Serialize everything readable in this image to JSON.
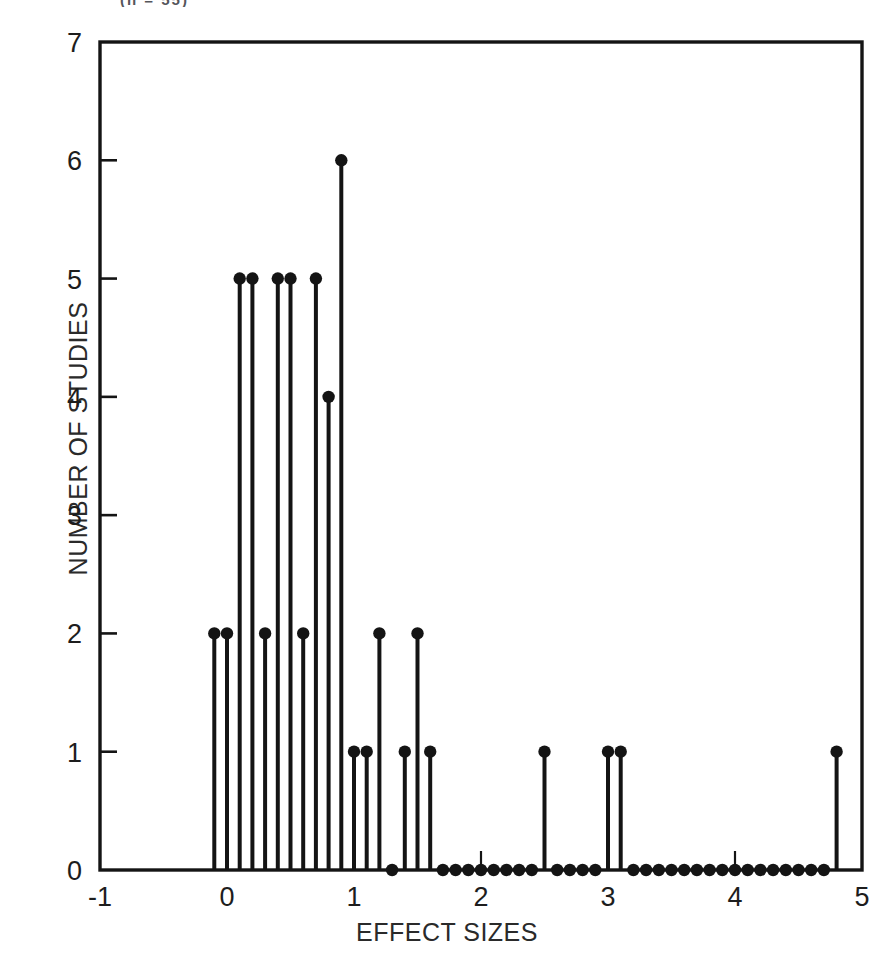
{
  "figure": {
    "top_note": "(n = 55)",
    "background_color": "#ffffff",
    "ink_color": "#141414"
  },
  "chart_data": {
    "type": "bar",
    "style": "stem",
    "title": "",
    "subtitle": "",
    "xlabel": "EFFECT SIZES",
    "ylabel": "NUMBER OF STUDIES",
    "xlim": [
      -1,
      5
    ],
    "ylim": [
      0,
      7
    ],
    "xticks": [
      -1,
      0,
      1,
      2,
      3,
      4,
      5
    ],
    "yticks": [
      0,
      1,
      2,
      3,
      4,
      5,
      6,
      7
    ],
    "xtick_labels": [
      "-1",
      "0",
      "1",
      "2",
      "3",
      "4",
      "5"
    ],
    "ytick_labels": [
      "0",
      "1",
      "2",
      "3",
      "4",
      "5",
      "6",
      "7"
    ],
    "grid": false,
    "legend": null,
    "tick_direction": "in",
    "marker": "filled-circle",
    "bin_width": 0.1,
    "x": [
      -0.1,
      0.0,
      0.1,
      0.2,
      0.3,
      0.4,
      0.5,
      0.6,
      0.7,
      0.8,
      0.9,
      1.0,
      1.1,
      1.2,
      1.3,
      1.4,
      1.5,
      1.6,
      1.7,
      1.8,
      1.9,
      2.0,
      2.1,
      2.2,
      2.3,
      2.4,
      2.5,
      2.6,
      2.7,
      2.8,
      2.9,
      3.0,
      3.1,
      3.2,
      3.3,
      3.4,
      3.5,
      3.6,
      3.7,
      3.8,
      3.9,
      4.0,
      4.1,
      4.2,
      4.3,
      4.4,
      4.5,
      4.6,
      4.7,
      4.8
    ],
    "values": [
      2,
      2,
      5,
      5,
      2,
      5,
      5,
      2,
      5,
      4,
      6,
      1,
      1,
      2,
      0,
      1,
      2,
      1,
      0,
      0,
      0,
      0,
      0,
      0,
      0,
      0,
      1,
      0,
      0,
      0,
      0,
      1,
      1,
      0,
      0,
      0,
      0,
      0,
      0,
      0,
      0,
      0,
      0,
      0,
      0,
      0,
      0,
      0,
      0,
      1
    ],
    "total_studies": 55
  }
}
